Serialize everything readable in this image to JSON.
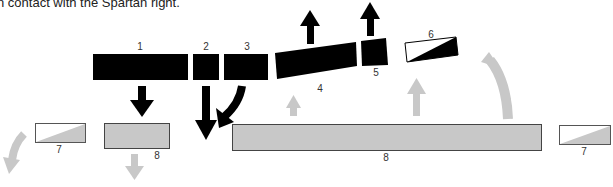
{
  "caption": "n contact with the Spartan right.",
  "units": [
    {
      "id": "block-1",
      "label": "1"
    },
    {
      "id": "block-2",
      "label": "2"
    },
    {
      "id": "block-3",
      "label": "3"
    },
    {
      "id": "block-4",
      "label": "4"
    },
    {
      "id": "block-5",
      "label": "5"
    },
    {
      "id": "block-6",
      "label": "6"
    },
    {
      "id": "block-7-left",
      "label": "7"
    },
    {
      "id": "block-8-left",
      "label": "8"
    },
    {
      "id": "block-8-main",
      "label": "8"
    },
    {
      "id": "block-7-right",
      "label": "7"
    }
  ],
  "colors": {
    "black_unit": "#000000",
    "grey_unit": "#c8c8c8",
    "grey_arrow": "#c8c8c8",
    "outline": "#444444"
  }
}
